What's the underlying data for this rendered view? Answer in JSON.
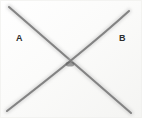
{
  "figure": {
    "background_color": "#fdfdfd",
    "paper_tint": "#f7f7f5",
    "stroke_color": "#7a7a7a",
    "stroke_color_dark": "#5a5a5a",
    "label_color": "#2e2e2e",
    "width": 142,
    "height": 118,
    "labels": [
      {
        "name": "label-a",
        "text": "A",
        "x": 16,
        "y": 34
      },
      {
        "name": "label-b",
        "text": "B",
        "x": 119,
        "y": 34
      }
    ],
    "crossing_point": {
      "x": 70,
      "y": 64
    },
    "curves": [
      {
        "name": "curve-a",
        "description": "stroke from upper-left descending through the crossing point to lower-right",
        "start": {
          "x": 9,
          "y": 7
        },
        "control": {
          "x": 56,
          "y": 48
        },
        "end": {
          "x": 131,
          "y": 113
        }
      },
      {
        "name": "curve-b",
        "description": "stroke from upper-right descending through the crossing point to lower-left",
        "start": {
          "x": 129,
          "y": 11
        },
        "control": {
          "x": 86,
          "y": 50
        },
        "end": {
          "x": 7,
          "y": 111
        }
      }
    ]
  }
}
